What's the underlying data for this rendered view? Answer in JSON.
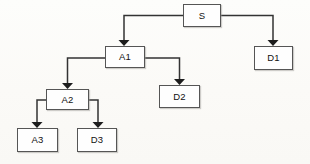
{
  "diagram": {
    "type": "tree-diagram",
    "title": "",
    "background_color": "#fdfcfa",
    "node_fill": "#fefefe",
    "node_border_color": "#555555",
    "edge_color": "#333333",
    "nodes": [
      {
        "id": "S",
        "label": "S",
        "x": 183,
        "y": 4,
        "w": 38,
        "h": 23
      },
      {
        "id": "D1",
        "label": "D1",
        "x": 254,
        "y": 46,
        "w": 39,
        "h": 24
      },
      {
        "id": "A1",
        "label": "A1",
        "x": 105,
        "y": 46,
        "w": 40,
        "h": 22
      },
      {
        "id": "D2",
        "label": "D2",
        "x": 159,
        "y": 85,
        "w": 41,
        "h": 23
      },
      {
        "id": "A2",
        "label": "A2",
        "x": 46,
        "y": 89,
        "w": 43,
        "h": 21
      },
      {
        "id": "A3",
        "label": "A3",
        "x": 17,
        "y": 128,
        "w": 41,
        "h": 24
      },
      {
        "id": "D3",
        "label": "D3",
        "x": 77,
        "y": 128,
        "w": 40,
        "h": 24
      }
    ],
    "edges": [
      {
        "from": "S",
        "to": "A1",
        "path": "M 183 15.5 L 124 15.5 L 124 41"
      },
      {
        "from": "S",
        "to": "D1",
        "path": "M 221 15.5 L 273 15.5 L 273 41"
      },
      {
        "from": "A1",
        "to": "A2",
        "path": "M 105 58 L 67.5 58 L 67.5 84"
      },
      {
        "from": "A1",
        "to": "D2",
        "path": "M 145 58 L 179.5 58 L 179.5 80"
      },
      {
        "from": "A2",
        "to": "A3",
        "path": "M 46 100 L 37 100 L 37 123"
      },
      {
        "from": "A2",
        "to": "D3",
        "path": "M 89 100 L 98 100 L 98 123"
      }
    ],
    "arrow_targets": [
      {
        "to": "A1",
        "x": 124,
        "y": 45
      },
      {
        "to": "D1",
        "x": 273,
        "y": 45
      },
      {
        "to": "A2",
        "x": 67.5,
        "y": 88
      },
      {
        "to": "D2",
        "x": 179.5,
        "y": 84
      },
      {
        "to": "A3",
        "x": 37,
        "y": 127
      },
      {
        "to": "D3",
        "x": 98,
        "y": 127
      }
    ]
  }
}
